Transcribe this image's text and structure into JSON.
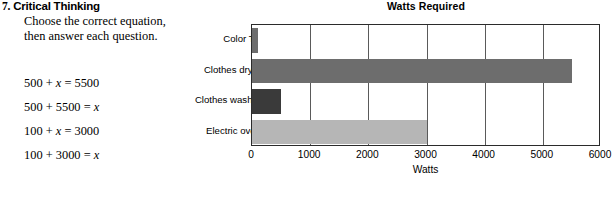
{
  "problem": {
    "number": "7.",
    "heading": "Critical Thinking",
    "prompt": "Choose the correct equation, then answer each question.",
    "equations": [
      {
        "lhs": "500 + ",
        "var1": "x",
        "mid": " = 5500",
        "var2": "",
        "full": "500 + x = 5500"
      },
      {
        "lhs": "500 + 5500 = ",
        "var1": "x",
        "mid": "",
        "var2": "",
        "full": "500 + 5500 = x"
      },
      {
        "lhs": "100 + ",
        "var1": "x",
        "mid": " = 3000",
        "var2": "",
        "full": "100 + x = 3000"
      },
      {
        "lhs": "100 + 3000 = ",
        "var1": "x",
        "mid": "",
        "var2": "",
        "full": "100 + 3000 = x"
      }
    ]
  },
  "chart_data": {
    "type": "bar",
    "orientation": "horizontal",
    "title": "Watts Required",
    "xlabel": "Watts",
    "ylabel": "",
    "categories": [
      "Color TV",
      "Clothes dryer",
      "Clothes washer",
      "Electric oven"
    ],
    "values": [
      100,
      5500,
      500,
      3000
    ],
    "colors": [
      "#6d6d6d",
      "#6d6d6d",
      "#3a3a3a",
      "#b6b6b6"
    ],
    "xlim": [
      0,
      6000
    ],
    "xticks": [
      0,
      1000,
      2000,
      3000,
      4000,
      5000,
      6000
    ],
    "xtick_labels": [
      "0",
      "1000",
      "2000",
      "3000",
      "4000",
      "5000",
      "6000"
    ],
    "grid": true,
    "grid_axis": "x",
    "legend": false
  }
}
